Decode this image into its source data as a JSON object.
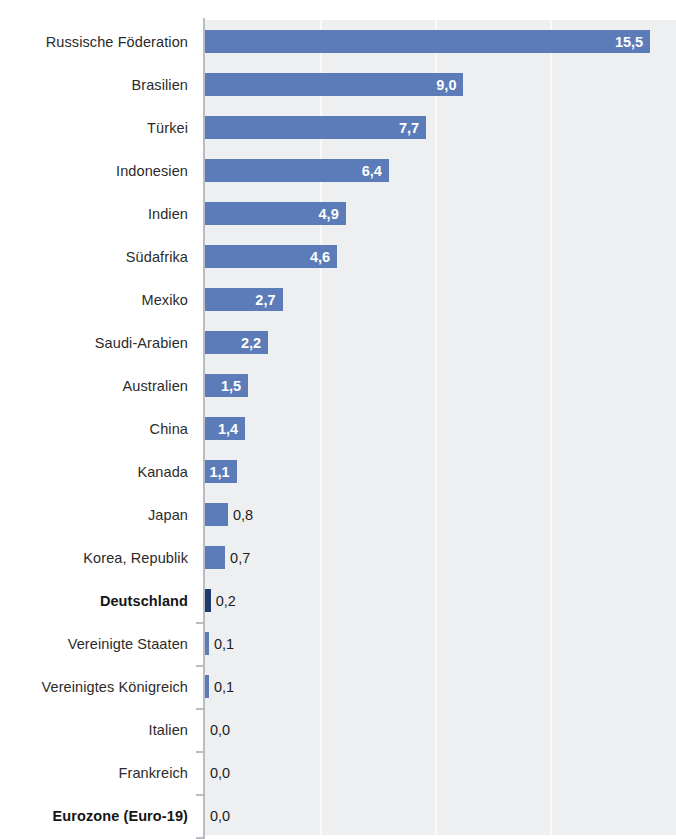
{
  "chart_data": {
    "type": "bar",
    "orientation": "horizontal",
    "title": "",
    "subtitle": "",
    "xlabel": "",
    "ylabel": "",
    "xlim": [
      0,
      16.4
    ],
    "gridlines": [
      4,
      8,
      12
    ],
    "grid": true,
    "legend": "none",
    "decimal_separator": ",",
    "highlight_categories": [
      "Deutschland",
      "Eurozone (Euro-19)"
    ],
    "colors": {
      "bar": "#5b7cb8",
      "bar_highlight": "#1f3a6e",
      "plot_background": "#edeff1",
      "page_background": "#ffffff",
      "gridline": "#fafafa",
      "axis": "#b9bcc0",
      "label_text": "#2b2b2b",
      "value_inside_text": "#ffffff",
      "value_outside_text": "#1d1d1d"
    },
    "categories": [
      "Russische Föderation",
      "Brasilien",
      "Türkei",
      "Indonesien",
      "Indien",
      "Südafrika",
      "Mexiko",
      "Saudi-Arabien",
      "Australien",
      "China",
      "Kanada",
      "Japan",
      "Korea, Republik",
      "Deutschland",
      "Vereinigte Staaten",
      "Vereinigtes Königreich",
      "Italien",
      "Frankreich",
      "Eurozone (Euro-19)"
    ],
    "values": [
      15.5,
      9.0,
      7.7,
      6.4,
      4.9,
      4.6,
      2.7,
      2.2,
      1.5,
      1.4,
      1.1,
      0.8,
      0.7,
      0.2,
      0.1,
      0.1,
      0.0,
      0.0,
      0.0
    ],
    "value_labels": [
      "15,5",
      "9,0",
      "7,7",
      "6,4",
      "4,9",
      "4,6",
      "2,7",
      "2,2",
      "1,5",
      "1,4",
      "1,1",
      "0,8",
      "0,7",
      "0,2",
      "0,1",
      "0,1",
      "0,0",
      "0,0",
      "0,0"
    ]
  },
  "rows": [
    {
      "label": "Russische Föderation",
      "value": 15.5,
      "value_label": "15,5",
      "bold": false,
      "highlight": false,
      "label_inside": true
    },
    {
      "label": "Brasilien",
      "value": 9.0,
      "value_label": "9,0",
      "bold": false,
      "highlight": false,
      "label_inside": true
    },
    {
      "label": "Türkei",
      "value": 7.7,
      "value_label": "7,7",
      "bold": false,
      "highlight": false,
      "label_inside": true
    },
    {
      "label": "Indonesien",
      "value": 6.4,
      "value_label": "6,4",
      "bold": false,
      "highlight": false,
      "label_inside": true
    },
    {
      "label": "Indien",
      "value": 4.9,
      "value_label": "4,9",
      "bold": false,
      "highlight": false,
      "label_inside": true
    },
    {
      "label": "Südafrika",
      "value": 4.6,
      "value_label": "4,6",
      "bold": false,
      "highlight": false,
      "label_inside": true
    },
    {
      "label": "Mexiko",
      "value": 2.7,
      "value_label": "2,7",
      "bold": false,
      "highlight": false,
      "label_inside": true
    },
    {
      "label": "Saudi-Arabien",
      "value": 2.2,
      "value_label": "2,2",
      "bold": false,
      "highlight": false,
      "label_inside": true
    },
    {
      "label": "Australien",
      "value": 1.5,
      "value_label": "1,5",
      "bold": false,
      "highlight": false,
      "label_inside": true
    },
    {
      "label": "China",
      "value": 1.4,
      "value_label": "1,4",
      "bold": false,
      "highlight": false,
      "label_inside": true
    },
    {
      "label": "Kanada",
      "value": 1.1,
      "value_label": "1,1",
      "bold": false,
      "highlight": false,
      "label_inside": true
    },
    {
      "label": "Japan",
      "value": 0.8,
      "value_label": "0,8",
      "bold": false,
      "highlight": false,
      "label_inside": false
    },
    {
      "label": "Korea, Republik",
      "value": 0.7,
      "value_label": "0,7",
      "bold": false,
      "highlight": false,
      "label_inside": false
    },
    {
      "label": "Deutschland",
      "value": 0.2,
      "value_label": "0,2",
      "bold": true,
      "highlight": true,
      "label_inside": false
    },
    {
      "label": "Vereinigte Staaten",
      "value": 0.1,
      "value_label": "0,1",
      "bold": false,
      "highlight": false,
      "label_inside": false
    },
    {
      "label": "Vereinigtes Königreich",
      "value": 0.1,
      "value_label": "0,1",
      "bold": false,
      "highlight": false,
      "label_inside": false
    },
    {
      "label": "Italien",
      "value": 0.0,
      "value_label": "0,0",
      "bold": false,
      "highlight": false,
      "label_inside": false
    },
    {
      "label": "Frankreich",
      "value": 0.0,
      "value_label": "0,0",
      "bold": false,
      "highlight": false,
      "label_inside": false
    },
    {
      "label": "Eurozone (Euro-19)",
      "value": 0.0,
      "value_label": "0,0",
      "bold": true,
      "highlight": false,
      "label_inside": false
    }
  ]
}
